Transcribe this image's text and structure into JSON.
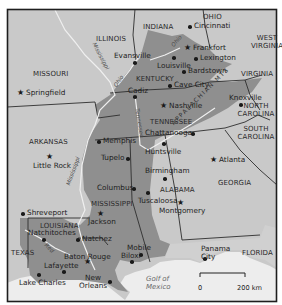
{
  "map": {
    "title": "",
    "colors": {
      "frame": "#222222",
      "background_land": "#c8c8c8",
      "highlight_region": "#8f8f8f",
      "light_land": "#d2d2d2",
      "water": "#ececec",
      "border": "#303030",
      "river": "#eeeeee"
    },
    "states": [
      {
        "name": "ILLINOIS"
      },
      {
        "name": "INDIANA"
      },
      {
        "name": "OHIO"
      },
      {
        "name": "WEST VIRGINIA"
      },
      {
        "name": "MISSOURI"
      },
      {
        "name": "KENTUCKY"
      },
      {
        "name": "VIRGINIA"
      },
      {
        "name": "TENNESSEE"
      },
      {
        "name": "NORTH CAROLINA"
      },
      {
        "name": "SOUTH CAROLINA"
      },
      {
        "name": "ARKANSAS"
      },
      {
        "name": "GEORGIA"
      },
      {
        "name": "MISSISSIPPI"
      },
      {
        "name": "ALABAMA"
      },
      {
        "name": "LOUISIANA"
      },
      {
        "name": "TEXAS"
      },
      {
        "name": "FLORIDA"
      }
    ],
    "cities": [
      {
        "name": "Cincinnati",
        "marker": "dot"
      },
      {
        "name": "Evansville",
        "marker": "dot"
      },
      {
        "name": "Frankfort",
        "marker": "star"
      },
      {
        "name": "Lexington",
        "marker": "dot"
      },
      {
        "name": "Louisville",
        "marker": "dot"
      },
      {
        "name": "Bardstown",
        "marker": "dot"
      },
      {
        "name": "Springfield",
        "marker": "star"
      },
      {
        "name": "Cave City",
        "marker": "dot"
      },
      {
        "name": "Cadiz",
        "marker": "dot"
      },
      {
        "name": "Nashville",
        "marker": "star"
      },
      {
        "name": "Knoxville",
        "marker": "dot"
      },
      {
        "name": "Memphis",
        "marker": "dot"
      },
      {
        "name": "Chattanooga",
        "marker": "dot"
      },
      {
        "name": "Little Rock",
        "marker": "star"
      },
      {
        "name": "Tupelo",
        "marker": "dot"
      },
      {
        "name": "Huntsville",
        "marker": "dot"
      },
      {
        "name": "Atlanta",
        "marker": "star"
      },
      {
        "name": "Birmingham",
        "marker": "dot"
      },
      {
        "name": "Columbus",
        "marker": "dot"
      },
      {
        "name": "Tuscaloosa",
        "marker": "dot"
      },
      {
        "name": "Jackson",
        "marker": "star"
      },
      {
        "name": "Montgomery",
        "marker": "star"
      },
      {
        "name": "Shreveport",
        "marker": "dot"
      },
      {
        "name": "Natchitoches",
        "marker": "dot"
      },
      {
        "name": "Natchez",
        "marker": "dot"
      },
      {
        "name": "Baton Rouge",
        "marker": "star"
      },
      {
        "name": "Lafayette",
        "marker": "dot"
      },
      {
        "name": "Mobile",
        "marker": "dot"
      },
      {
        "name": "Biloxi",
        "marker": "dot"
      },
      {
        "name": "Panama City",
        "marker": "dot"
      },
      {
        "name": "Lake Charles",
        "marker": "dot"
      },
      {
        "name": "New Orleans",
        "marker": "dot"
      }
    ],
    "rivers": [
      "Mississippi",
      "Ohio",
      "Tennessee",
      "Red"
    ],
    "mountains": "APPALACHIAN MTS",
    "water_bodies": [
      "Golf of",
      "Mexico"
    ],
    "scale_bar": {
      "start": "0",
      "end": "200 km"
    }
  }
}
